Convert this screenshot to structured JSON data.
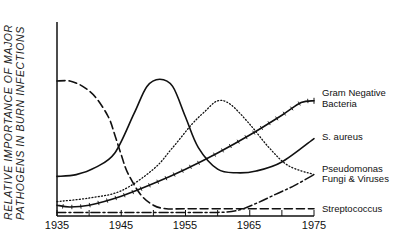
{
  "chart_data": {
    "type": "line",
    "title": "",
    "xlabel": "",
    "ylabel": "RELATIVE IMPORTANCE OF MAJOR PATHOGENS IN BURN INFECTIONS",
    "ylabel_lines": [
      "RELATIVE IMPORTANCE OF MAJOR",
      "PATHOGENS IN BURN INFECTIONS"
    ],
    "x_ticks": [
      "1935",
      "1945",
      "1955",
      "1965",
      "1975"
    ],
    "xlim": [
      1935,
      1975
    ],
    "ylim": [
      0,
      100
    ],
    "grid": false,
    "legend_position": "right, inline labels at line ends",
    "series": [
      {
        "name": "Gram Negative Bacteria",
        "label_lines": [
          "Gram Negative",
          "Bacteria"
        ],
        "style": "solid with tick marks",
        "x": [
          1935,
          1937,
          1940,
          1945,
          1950,
          1955,
          1960,
          1965,
          1970,
          1973,
          1975
        ],
        "values": [
          6,
          5,
          6,
          11,
          18,
          26,
          35,
          45,
          56,
          63,
          64
        ]
      },
      {
        "name": "S. aureus",
        "label_lines": [
          "S. aureus"
        ],
        "style": "solid",
        "x": [
          1935,
          1938,
          1941,
          1944,
          1947,
          1949,
          1951,
          1953,
          1955,
          1957,
          1960,
          1963,
          1966,
          1970,
          1975
        ],
        "values": [
          22,
          23,
          27,
          35,
          57,
          72,
          76,
          72,
          55,
          38,
          26,
          24,
          25,
          30,
          43
        ]
      },
      {
        "name": "Pseudomonas",
        "label_lines": [
          "Pseudomonas"
        ],
        "style": "dotted",
        "x": [
          1935,
          1940,
          1945,
          1950,
          1953,
          1956,
          1958,
          1960,
          1962,
          1965,
          1968,
          1971,
          1975
        ],
        "values": [
          8,
          10,
          14,
          26,
          38,
          51,
          58,
          64,
          62,
          51,
          38,
          28,
          23
        ]
      },
      {
        "name": "Fungi & Viruses",
        "label_lines": [
          "Fungi & Viruses"
        ],
        "style": "dash-dot",
        "x": [
          1935,
          1945,
          1955,
          1960,
          1963,
          1966,
          1969,
          1972,
          1975
        ],
        "values": [
          2,
          2,
          2,
          2,
          3,
          7,
          12,
          17,
          23
        ]
      },
      {
        "name": "Streptococcus",
        "label_lines": [
          "Streptococcus"
        ],
        "style": "dashed",
        "x": [
          1935,
          1937,
          1939,
          1941,
          1943,
          1944,
          1945,
          1946,
          1948,
          1950,
          1952,
          1955,
          1965,
          1975
        ],
        "values": [
          75,
          75,
          72,
          66,
          55,
          45,
          34,
          24,
          12,
          6,
          4,
          4,
          4,
          4
        ]
      }
    ]
  }
}
